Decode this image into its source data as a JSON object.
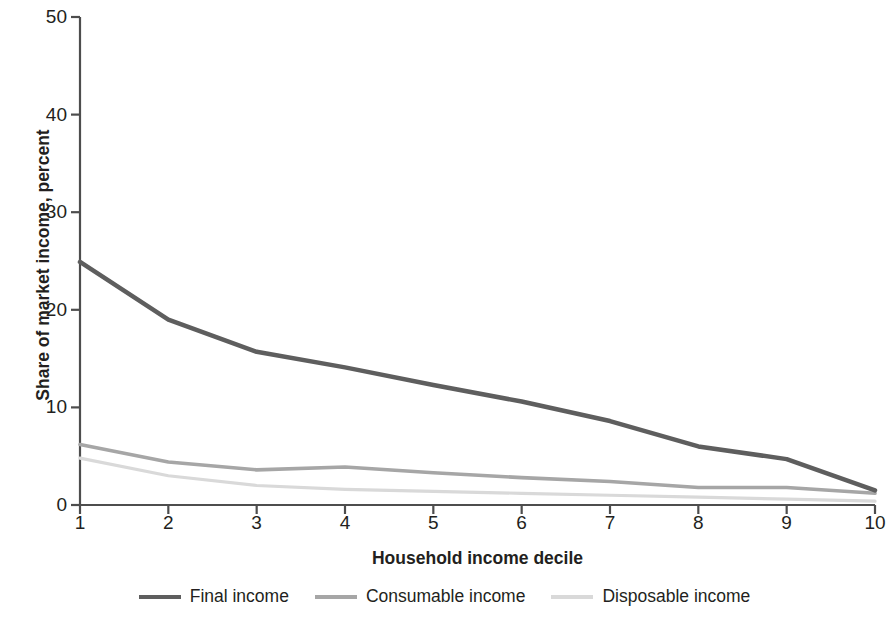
{
  "chart_data": {
    "type": "line",
    "title": "",
    "xlabel": "Household income decile",
    "ylabel": "Share of market income, percent",
    "categories": [
      "1",
      "2",
      "3",
      "4",
      "5",
      "6",
      "7",
      "8",
      "9",
      "10"
    ],
    "x": [
      1,
      2,
      3,
      4,
      5,
      6,
      7,
      8,
      9,
      10
    ],
    "xlim": [
      1,
      10
    ],
    "ylim": [
      0,
      50
    ],
    "yticks": [
      0,
      10,
      20,
      30,
      40,
      50
    ],
    "xticks": [
      1,
      2,
      3,
      4,
      5,
      6,
      7,
      8,
      9,
      10
    ],
    "grid": false,
    "legend_position": "bottom",
    "series": [
      {
        "name": "Final income",
        "color": "#5e5e5e",
        "width": 4.5,
        "values": [
          24.9,
          19.0,
          15.7,
          14.1,
          12.3,
          10.6,
          8.6,
          6.0,
          4.7,
          1.5
        ]
      },
      {
        "name": "Consumable income",
        "color": "#a6a6a6",
        "width": 3.6,
        "values": [
          6.2,
          4.4,
          3.6,
          3.9,
          3.3,
          2.8,
          2.4,
          1.8,
          1.8,
          1.2
        ]
      },
      {
        "name": "Disposable income",
        "color": "#d9d9d9",
        "width": 3.2,
        "values": [
          4.8,
          3.0,
          2.0,
          1.6,
          1.4,
          1.2,
          1.0,
          0.8,
          0.6,
          0.4
        ]
      }
    ]
  },
  "axis": {
    "y_labels": [
      "0",
      "10",
      "20",
      "30",
      "40",
      "50"
    ],
    "x_labels": [
      "1",
      "2",
      "3",
      "4",
      "5",
      "6",
      "7",
      "8",
      "9",
      "10"
    ],
    "y_title": "Share of market income, percent",
    "x_title": "Household income decile"
  },
  "legend": {
    "items": [
      {
        "label": "Final income",
        "color": "#5e5e5e"
      },
      {
        "label": "Consumable income",
        "color": "#a6a6a6"
      },
      {
        "label": "Disposable income",
        "color": "#d9d9d9"
      }
    ]
  },
  "style": {
    "axis_color": "#4d4d4d",
    "text_color": "#231f20",
    "background": "#ffffff"
  }
}
